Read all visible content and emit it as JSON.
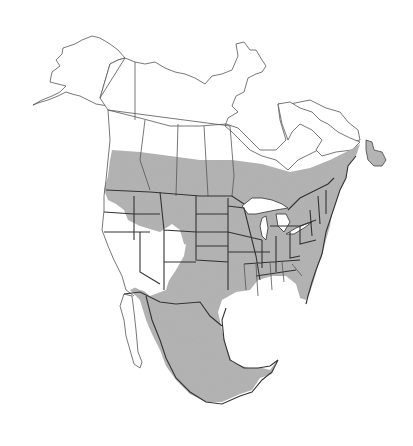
{
  "map": {
    "type": "species-range-map",
    "region": "North America",
    "legend": [],
    "colors": {
      "background": "#ffffff",
      "land": "#ffffff",
      "range_fill": "#b4b4b4",
      "outline": "#555555",
      "range_outline": "#333333"
    },
    "range": {
      "description": "Shaded range covers southern Canada, most of the contiguous United States (excluding the Great Basin / far-west interior), and Mexico; Newfoundland shaded.",
      "excluded_areas": [
        "Alaska",
        "Yukon",
        "Northwest Territories",
        "Nunavut",
        "northern Quebec / Labrador",
        "California interior",
        "Nevada",
        "Utah",
        "Baja California"
      ]
    }
  }
}
